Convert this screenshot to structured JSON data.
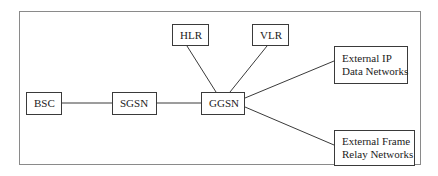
{
  "diagram": {
    "type": "network-architecture",
    "nodes": [
      {
        "id": "bsc",
        "label": "BSC"
      },
      {
        "id": "sgsn",
        "label": "SGSN"
      },
      {
        "id": "ggsn",
        "label": "GGSN"
      },
      {
        "id": "hlr",
        "label": "HLR"
      },
      {
        "id": "vlr",
        "label": "VLR"
      },
      {
        "id": "ext_ip",
        "lines": [
          "External IP",
          "Data Networks"
        ]
      },
      {
        "id": "ext_fr",
        "lines": [
          "External Frame",
          "Relay Networks"
        ]
      }
    ],
    "edges": [
      {
        "from": "bsc",
        "to": "sgsn"
      },
      {
        "from": "sgsn",
        "to": "ggsn"
      },
      {
        "from": "hlr",
        "to": "ggsn"
      },
      {
        "from": "vlr",
        "to": "ggsn"
      },
      {
        "from": "ggsn",
        "to": "ext_ip"
      },
      {
        "from": "ggsn",
        "to": "ext_fr"
      }
    ]
  }
}
